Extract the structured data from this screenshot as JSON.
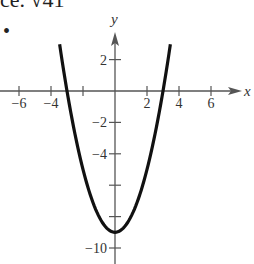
{
  "header": {
    "clipped_text": "ce.  √41",
    "bullet": "•"
  },
  "chart_data": {
    "type": "line",
    "title": "",
    "xlabel": "x",
    "ylabel": "y",
    "function": "y = x^2 - 9",
    "x": [
      -3.46,
      -3,
      -2,
      -1,
      0,
      1,
      2,
      3,
      3.46
    ],
    "y": [
      3,
      0,
      -5,
      -8,
      -9,
      -8,
      -5,
      0,
      3
    ],
    "vertex": [
      0,
      -9
    ],
    "x_intercepts": [
      -3,
      3
    ],
    "xlim": [
      -7,
      7.8
    ],
    "ylim": [
      -11,
      4.5
    ],
    "x_ticks": [
      -6,
      -4,
      -2,
      2,
      4,
      6
    ],
    "x_tick_labels": [
      "−6",
      "−4",
      "",
      "2",
      "4",
      "6"
    ],
    "x_ticks_all": [
      -6,
      -4,
      -2,
      2,
      4,
      6
    ],
    "y_ticks": [
      2,
      -2,
      -4,
      -6,
      -8,
      -10
    ],
    "y_tick_labels": [
      "2",
      "−2",
      "−4",
      "",
      "",
      "−10"
    ],
    "grid": false,
    "legend": null
  },
  "colors": {
    "curve": "#111111",
    "axis": "#555555",
    "text": "#333333"
  }
}
